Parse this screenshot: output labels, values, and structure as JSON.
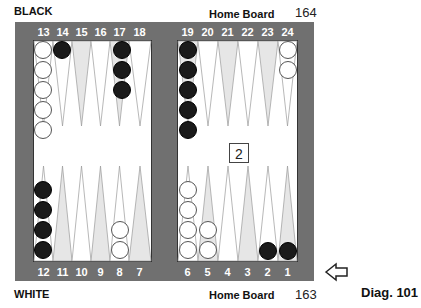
{
  "labels": {
    "top_player": "BLACK",
    "bottom_player": "WHITE",
    "top_home": "Home Board",
    "bottom_home": "Home Board",
    "top_pipcount": "164",
    "bottom_pipcount": "163",
    "diagram": "Diag. 101"
  },
  "cube": {
    "value": "2"
  },
  "colors": {
    "frame": "#707070",
    "board": "#ffffff",
    "point_shaded": "#e6e6e6",
    "black": "#1a1a1a",
    "white": "#ffffff"
  },
  "top_points": [
    "13",
    "14",
    "15",
    "16",
    "17",
    "18",
    "19",
    "20",
    "21",
    "22",
    "23",
    "24"
  ],
  "bottom_points": [
    "12",
    "11",
    "10",
    "9",
    "8",
    "7",
    "6",
    "5",
    "4",
    "3",
    "2",
    "1"
  ],
  "position": {
    "24": {
      "color": "white",
      "count": 2
    },
    "19": {
      "color": "black",
      "count": 5
    },
    "17": {
      "color": "black",
      "count": 3
    },
    "14": {
      "color": "black",
      "count": 1
    },
    "13": {
      "color": "white",
      "count": 5
    },
    "12": {
      "color": "black",
      "count": 4
    },
    "8": {
      "color": "white",
      "count": 2
    },
    "6": {
      "color": "white",
      "count": 4
    },
    "5": {
      "color": "white",
      "count": 2
    },
    "2": {
      "color": "black",
      "count": 1
    },
    "1": {
      "color": "black",
      "count": 1
    }
  },
  "arrow": {
    "direction": "left",
    "icon": "outline-arrow-left"
  }
}
